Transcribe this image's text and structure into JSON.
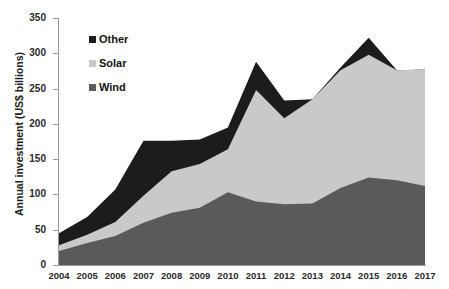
{
  "chart_data": {
    "type": "area",
    "stacked": true,
    "title": "",
    "subtitle": "",
    "xlabel": "",
    "ylabel": "Annual investment (US$ billions)",
    "categories": [
      "2004",
      "2005",
      "2006",
      "2007",
      "2008",
      "2009",
      "2010",
      "2011",
      "2012",
      "2013",
      "2014",
      "2015",
      "2016",
      "2017"
    ],
    "x": [
      2004,
      2005,
      2006,
      2007,
      2008,
      2009,
      2010,
      2011,
      2012,
      2013,
      2014,
      2015,
      2016,
      2017
    ],
    "ylim": [
      0,
      350
    ],
    "xlim": [
      2004,
      2017
    ],
    "yticks": [
      0,
      50,
      100,
      150,
      200,
      250,
      300,
      350
    ],
    "ytick_labels": [
      "0",
      "50",
      "100",
      "150",
      "200",
      "250",
      "300",
      "350"
    ],
    "xtick_labels": [
      "2004",
      "2005",
      "2006",
      "2007",
      "2008",
      "2009",
      "2010",
      "2011",
      "2012",
      "2013",
      "2014",
      "2015",
      "2016",
      "2017"
    ],
    "grid": false,
    "legend_position": "upper left inside",
    "series": [
      {
        "name": "Wind",
        "color": "#5a5a5a",
        "values": [
          20,
          31,
          41,
          60,
          74,
          81,
          103,
          90,
          86,
          87,
          109,
          124,
          120,
          112
        ]
      },
      {
        "name": "Solar",
        "color": "#c9c9c9",
        "values": [
          8,
          12,
          20,
          38,
          59,
          62,
          61,
          158,
          122,
          148,
          167,
          174,
          156,
          165
        ]
      },
      {
        "name": "Other",
        "color": "#1c1c1c",
        "values": [
          17,
          25,
          46,
          78,
          43,
          35,
          31,
          40,
          25,
          0,
          4,
          24,
          0,
          0
        ]
      }
    ],
    "stack_tops": {
      "wind": [
        20,
        31,
        41,
        60,
        74,
        81,
        103,
        90,
        86,
        87,
        109,
        124,
        120,
        112
      ],
      "solar": [
        28,
        43,
        61,
        98,
        133,
        143,
        164,
        248,
        208,
        235,
        276,
        298,
        276,
        277
      ],
      "total": [
        45,
        68,
        107,
        176,
        176,
        178,
        195,
        288,
        233,
        235,
        280,
        322,
        276,
        277
      ]
    },
    "legend": [
      {
        "label": "Other",
        "color": "#1c1c1c"
      },
      {
        "label": "Solar",
        "color": "#c9c9c9"
      },
      {
        "label": "Wind",
        "color": "#5a5a5a"
      }
    ],
    "axis_color": "#9a9a9a",
    "background": "#ffffff"
  }
}
